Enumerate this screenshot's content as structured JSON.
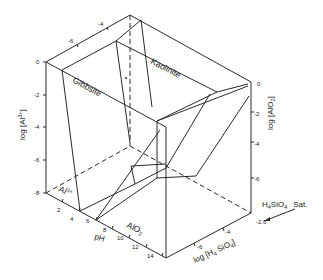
{
  "figure": {
    "type": "3D stability field diagram (Al–Si–H2O system)",
    "colors": {
      "line": "#2a2a2a",
      "background": "#ffffff",
      "text": "#222222"
    }
  },
  "axes": {
    "left_vertical": {
      "label": "log [Al3+]",
      "label_parts": {
        "pre": "log ",
        "bracket_l": "[",
        "species": "Al",
        "sup": "3+",
        "bracket_r": "]"
      },
      "ticks": [
        "0",
        "-2",
        "-4",
        "-6",
        "-8"
      ]
    },
    "right_vertical": {
      "label": "log [AlO2-]",
      "label_parts": {
        "pre": "log ",
        "bracket_l": "[",
        "species": "AlO",
        "sub": "2",
        "bracket_r": "]"
      },
      "ticks": [
        "0",
        "-2",
        "-4",
        "-6"
      ]
    },
    "ph_axis": {
      "label": "pH",
      "ticks": [
        "2",
        "4",
        "6",
        "8",
        "10",
        "12",
        "14"
      ]
    },
    "silica_axis": {
      "label": "log [H4 SiO4]",
      "label_parts": {
        "pre": "log ",
        "bracket_l": "[",
        "h": "H",
        "h_sub": "4",
        "rest": " SiO",
        "o_sub": "4",
        "bracket_r": "]"
      },
      "ticks": [
        "-2.6",
        "-4",
        "-6"
      ],
      "top_ticks": [
        "-4",
        "-6"
      ]
    }
  },
  "labels": {
    "gibbsite": "Gibbsite",
    "kaolinite": "Kaolinite",
    "al3_region": "Al3+",
    "al3_region_parts": {
      "species": "Al",
      "sup": "3+"
    },
    "alo2_region": "AlO2",
    "alo2_region_parts": {
      "species": "AlO",
      "sub": "2"
    },
    "saturation": "H4SiO4 Sat.",
    "saturation_parts": {
      "h": "H",
      "h_sub": "4",
      "rest": "SiO",
      "o_sub": "4",
      "sat": "Sat."
    }
  }
}
